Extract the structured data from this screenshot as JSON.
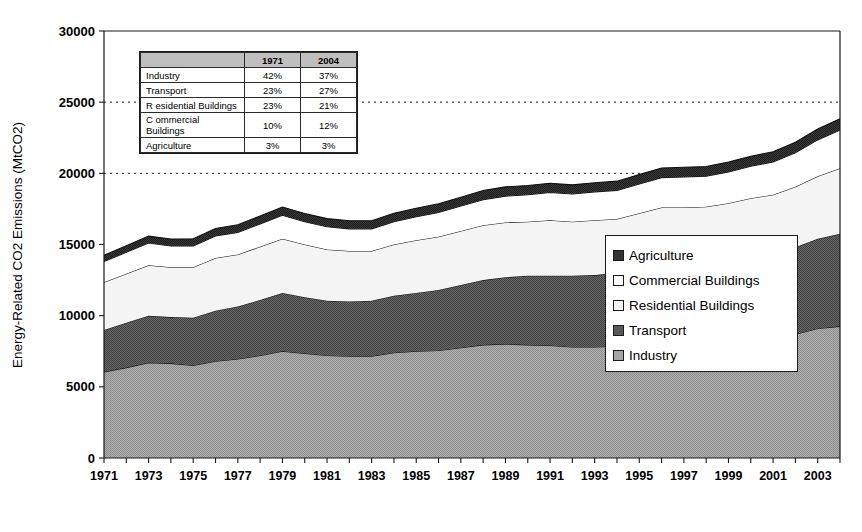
{
  "chart_data": {
    "type": "area",
    "stacked": true,
    "title": "",
    "xlabel": "",
    "ylabel": "Energy-Related CO2 Emissions (MtCO2)",
    "ylim": [
      0,
      30000
    ],
    "ytick_values": [
      0,
      5000,
      10000,
      15000,
      20000,
      25000,
      30000
    ],
    "ytick_labels": [
      "0",
      "5000",
      "10000",
      "15000",
      "20000",
      "25000",
      "30000"
    ],
    "gridlines": [
      20000,
      25000
    ],
    "grid": "dotted-horizontal-partial",
    "legend_position": "middle-right",
    "x": [
      1971,
      1972,
      1973,
      1974,
      1975,
      1976,
      1977,
      1978,
      1979,
      1980,
      1981,
      1982,
      1983,
      1984,
      1985,
      1986,
      1987,
      1988,
      1989,
      1990,
      1991,
      1992,
      1993,
      1994,
      1995,
      1996,
      1997,
      1998,
      1999,
      2000,
      2001,
      2002,
      2003,
      2004
    ],
    "xtick_labels": [
      "1971",
      "1973",
      "1975",
      "1977",
      "1979",
      "1981",
      "1983",
      "1985",
      "1987",
      "1989",
      "1991",
      "1993",
      "1995",
      "1997",
      "1999",
      "2001",
      "2003"
    ],
    "series": [
      {
        "name": "Industry",
        "color": "#a6a6a6",
        "values": [
          6050,
          6350,
          6700,
          6650,
          6500,
          6800,
          6950,
          7200,
          7500,
          7350,
          7200,
          7150,
          7150,
          7400,
          7500,
          7550,
          7750,
          7950,
          8000,
          7950,
          7900,
          7800,
          7800,
          7850,
          8000,
          8150,
          8150,
          8100,
          8150,
          8300,
          8400,
          8700,
          9100,
          9250
        ]
      },
      {
        "name": "Transport",
        "color": "#595959",
        "values": [
          2950,
          3150,
          3300,
          3250,
          3350,
          3550,
          3700,
          3900,
          4100,
          3950,
          3850,
          3850,
          3900,
          4000,
          4100,
          4250,
          4400,
          4550,
          4700,
          4850,
          4900,
          5000,
          5050,
          5150,
          5300,
          5450,
          5550,
          5650,
          5800,
          5900,
          5950,
          6100,
          6300,
          6500
        ]
      },
      {
        "name": "Residential Buildings",
        "color": "#f2f2f2",
        "values": [
          3350,
          3450,
          3550,
          3500,
          3550,
          3700,
          3650,
          3750,
          3800,
          3700,
          3600,
          3550,
          3500,
          3600,
          3700,
          3750,
          3800,
          3850,
          3850,
          3800,
          3900,
          3800,
          3850,
          3800,
          3900,
          4000,
          3900,
          3900,
          3950,
          4050,
          4150,
          4250,
          4400,
          4600
        ]
      },
      {
        "name": "Commercial Buildings",
        "color": "#ffffff",
        "values": [
          1450,
          1500,
          1550,
          1500,
          1500,
          1550,
          1550,
          1600,
          1650,
          1600,
          1600,
          1550,
          1550,
          1600,
          1650,
          1700,
          1750,
          1800,
          1850,
          1900,
          1950,
          1950,
          2000,
          2000,
          2050,
          2100,
          2150,
          2150,
          2200,
          2250,
          2300,
          2400,
          2550,
          2700
        ]
      },
      {
        "name": "Agriculture",
        "color": "#333333",
        "values": [
          450,
          470,
          490,
          490,
          500,
          520,
          540,
          560,
          580,
          580,
          570,
          570,
          570,
          590,
          600,
          610,
          620,
          640,
          650,
          650,
          650,
          640,
          640,
          650,
          660,
          670,
          680,
          680,
          690,
          700,
          710,
          730,
          760,
          790
        ]
      }
    ],
    "totals": [
      14250,
      14920,
      15590,
      15390,
      15400,
      16120,
      16390,
      17010,
      17630,
      17180,
      16820,
      16670,
      16670,
      17190,
      17550,
      17860,
      18320,
      18790,
      19050,
      19150,
      19300,
      19190,
      19340,
      19450,
      19910,
      20370,
      20430,
      20480,
      20790,
      21200,
      21510,
      22180,
      23110,
      23840
    ]
  },
  "axis": {
    "y_title": "Energy-Related CO2 Emissions (MtCO2)"
  },
  "legend": {
    "items": [
      {
        "label": "Agriculture",
        "swatch": "#333333"
      },
      {
        "label": "Commercial Buildings",
        "swatch": "#ffffff"
      },
      {
        "label": "Residential Buildings",
        "swatch": "#f2f2f2"
      },
      {
        "label": "Transport",
        "swatch": "#595959"
      },
      {
        "label": "Industry",
        "swatch": "#a6a6a6"
      }
    ]
  },
  "inset_table": {
    "corner_header": "",
    "column_headers": [
      "1971",
      "2004"
    ],
    "rows": [
      {
        "sector": "Industry",
        "v1971": "42%",
        "v2004": "37%"
      },
      {
        "sector": "Transport",
        "v1971": "23%",
        "v2004": "27%"
      },
      {
        "sector": "R esidential Buildings",
        "v1971": "23%",
        "v2004": "21%"
      },
      {
        "sector": "C ommercial Buildings",
        "v1971": "10%",
        "v2004": "12%"
      },
      {
        "sector": " Agriculture",
        "v1971": "3%",
        "v2004": "3%"
      }
    ]
  }
}
